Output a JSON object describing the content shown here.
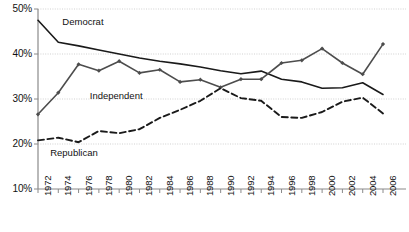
{
  "chart_data": {
    "type": "line",
    "title": "",
    "subtitle": "",
    "xlabel": "",
    "ylabel": "",
    "x": [
      1972,
      1974,
      1976,
      1978,
      1980,
      1982,
      1984,
      1986,
      1988,
      1990,
      1992,
      1994,
      1996,
      1998,
      2000,
      2002,
      2004,
      2006
    ],
    "categories": [
      "1972",
      "1974",
      "1976",
      "1978",
      "1980",
      "1982",
      "1984",
      "1986",
      "1988",
      "1990",
      "1992",
      "1994",
      "1996",
      "1998",
      "2000",
      "2002",
      "2004",
      "2006"
    ],
    "ylim": [
      10,
      50
    ],
    "ytick_labels": [
      "10%",
      "20%",
      "30%",
      "40%",
      "50%"
    ],
    "ytick_values": [
      10,
      20,
      30,
      40,
      50
    ],
    "grid": true,
    "legend_position": "inline-annotations",
    "series": [
      {
        "name": "Democrat",
        "style": "solid",
        "color": "#1a1a1a",
        "markers": false,
        "label_x": 1974.4,
        "label_y": 47.2,
        "values": [
          47.5,
          42.6,
          41.8,
          40.9,
          40.0,
          39.1,
          38.4,
          37.8,
          37.1,
          36.3,
          35.6,
          36.2,
          34.4,
          33.8,
          32.4,
          32.5,
          33.6,
          31.0
        ]
      },
      {
        "name": "Independent",
        "style": "solid",
        "color": "#4d4d4d",
        "markers": true,
        "label_x": 1977.1,
        "label_y": 30.6,
        "values": [
          26.6,
          31.4,
          37.7,
          36.3,
          38.4,
          35.8,
          36.5,
          33.8,
          34.3,
          32.6,
          34.4,
          34.4,
          38.0,
          38.6,
          41.2,
          38.0,
          35.5,
          42.2
        ]
      },
      {
        "name": "Republican",
        "style": "dashed",
        "color": "#1a1a1a",
        "markers": false,
        "label_x": 1973.2,
        "label_y": 17.9,
        "values": [
          20.8,
          21.4,
          20.4,
          22.9,
          22.4,
          23.3,
          25.8,
          27.6,
          29.6,
          32.4,
          30.2,
          29.6,
          26.0,
          25.8,
          27.1,
          29.4,
          30.3,
          26.8
        ]
      }
    ]
  },
  "axes": {
    "y_axis_name": "percent-axis",
    "x_axis_name": "year-axis"
  }
}
